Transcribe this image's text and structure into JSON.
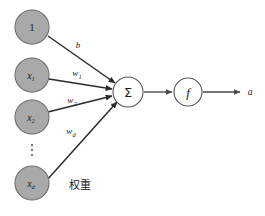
{
  "diagram": {
    "colors": {
      "input_node_fill": "#a9a9a9",
      "input_node_stroke": "#6e6e6e",
      "op_node_fill": "#ffffff",
      "op_node_stroke": "#555555",
      "edge": "#2b2b2b",
      "text": "#1a1a1a",
      "background": "#ffffff"
    },
    "input_nodes": [
      {
        "id": "bias-input",
        "label": "1",
        "sub": "",
        "cx": 32,
        "cy": 27,
        "r": 17
      },
      {
        "id": "input-x1",
        "label": "x",
        "sub": "1",
        "cx": 32,
        "cy": 75,
        "r": 17
      },
      {
        "id": "input-x2",
        "label": "x",
        "sub": "2",
        "cx": 32,
        "cy": 117,
        "r": 17
      },
      {
        "id": "input-xd",
        "label": "x",
        "sub": "d",
        "cx": 32,
        "cy": 183,
        "r": 17
      }
    ],
    "ellipsis": {
      "label": "⋮",
      "cx": 32,
      "cy": 150
    },
    "sum_node": {
      "id": "sum-node",
      "label": "Σ",
      "cx": 128,
      "cy": 92,
      "r": 15
    },
    "activation_node": {
      "id": "activation-node",
      "label": "f",
      "cx": 188,
      "cy": 92,
      "r": 14
    },
    "edges": [
      {
        "id": "edge-bias",
        "label": "b",
        "sub": "",
        "label_x": 78,
        "label_y": 45,
        "x1": 48,
        "y1": 36,
        "x2": 115,
        "y2": 83
      },
      {
        "id": "edge-w1",
        "label": "w",
        "sub": "1",
        "label_x": 77,
        "label_y": 73,
        "x1": 49,
        "y1": 79,
        "x2": 113,
        "y2": 89
      },
      {
        "id": "edge-w2",
        "label": "w",
        "sub": "2",
        "label_x": 72,
        "label_y": 100,
        "x1": 48,
        "y1": 112,
        "x2": 113,
        "y2": 95
      },
      {
        "id": "edge-wd",
        "label": "w",
        "sub": "d",
        "label_x": 71,
        "label_y": 131,
        "x1": 47,
        "y1": 180,
        "x2": 116,
        "y2": 101
      }
    ],
    "sum_to_activation": {
      "id": "edge-sum-activation",
      "x1": 144,
      "y1": 92,
      "x2": 172,
      "y2": 92
    },
    "activation_to_output": {
      "id": "edge-activation-output",
      "x1": 203,
      "y1": 92,
      "x2": 240,
      "y2": 92
    },
    "output": {
      "id": "output-a",
      "label": "a",
      "x": 250,
      "y": 92
    },
    "weights_annotation": {
      "id": "weights-annotation",
      "label": "权重",
      "x": 80,
      "y": 185
    }
  }
}
